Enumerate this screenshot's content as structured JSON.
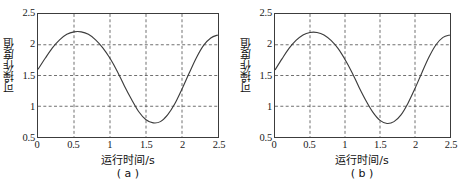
{
  "figure": {
    "panels": [
      {
        "caption": "( a )",
        "chart_data": {
          "type": "line",
          "title": "",
          "xlabel": "运行时间/s",
          "ylabel": "可操作度值",
          "xlim": [
            0,
            2.5
          ],
          "ylim": [
            0.5,
            2.5
          ],
          "xticks": [
            "0",
            "0.5",
            "1",
            "1.5",
            "2",
            "2.5"
          ],
          "xtick_values": [
            0,
            0.5,
            1,
            1.5,
            2,
            2.5
          ],
          "yticks": [
            "0.5",
            "1",
            "1.5",
            "2",
            "2.5"
          ],
          "ytick_values": [
            0.5,
            1,
            1.5,
            2,
            2.5
          ],
          "grid": true,
          "grid_style": "dashed",
          "legend": null,
          "series": [
            {
              "name": "可操作度值",
              "color": "#3c3c3c",
              "x": [
                0,
                0.1,
                0.2,
                0.3,
                0.4,
                0.5,
                0.6,
                0.7,
                0.8,
                0.9,
                1.0,
                1.1,
                1.2,
                1.3,
                1.4,
                1.5,
                1.6,
                1.7,
                1.8,
                1.9,
                2.0,
                2.1,
                2.2,
                2.3,
                2.4,
                2.5
              ],
              "y": [
                1.6,
                1.78,
                1.95,
                2.08,
                2.17,
                2.21,
                2.21,
                2.17,
                2.08,
                1.95,
                1.78,
                1.57,
                1.33,
                1.11,
                0.91,
                0.78,
                0.73,
                0.75,
                0.86,
                1.04,
                1.28,
                1.54,
                1.79,
                1.99,
                2.11,
                2.16
              ]
            }
          ]
        }
      },
      {
        "caption": "( b )",
        "chart_data": {
          "type": "line",
          "title": "",
          "xlabel": "运行时间/s",
          "ylabel": "可操作度值",
          "xlim": [
            0,
            2.5
          ],
          "ylim": [
            0.5,
            2.5
          ],
          "xticks": [
            "0",
            "0.5",
            "1",
            "1.5",
            "2",
            "2.5"
          ],
          "xtick_values": [
            0,
            0.5,
            1,
            1.5,
            2,
            2.5
          ],
          "yticks": [
            "0.5",
            "1",
            "1.5",
            "2",
            "2.5"
          ],
          "ytick_values": [
            0.5,
            1,
            1.5,
            2,
            2.5
          ],
          "grid": true,
          "grid_style": "dashed",
          "legend": null,
          "series": [
            {
              "name": "可操作度值",
              "color": "#3c3c3c",
              "x": [
                0,
                0.1,
                0.2,
                0.3,
                0.4,
                0.5,
                0.6,
                0.7,
                0.8,
                0.9,
                1.0,
                1.1,
                1.2,
                1.3,
                1.4,
                1.5,
                1.6,
                1.7,
                1.8,
                1.9,
                2.0,
                2.1,
                2.2,
                2.3,
                2.4,
                2.5
              ],
              "y": [
                1.59,
                1.77,
                1.94,
                2.07,
                2.16,
                2.2,
                2.2,
                2.16,
                2.07,
                1.94,
                1.76,
                1.55,
                1.31,
                1.09,
                0.9,
                0.77,
                0.72,
                0.75,
                0.86,
                1.05,
                1.29,
                1.55,
                1.8,
                2.0,
                2.12,
                2.16
              ]
            }
          ]
        }
      }
    ],
    "colors": {
      "curve": "#3c3c3c",
      "axis": "#3c3c3c",
      "grid": "#4a4a4a",
      "background": "#ffffff",
      "text": "#111111"
    }
  }
}
